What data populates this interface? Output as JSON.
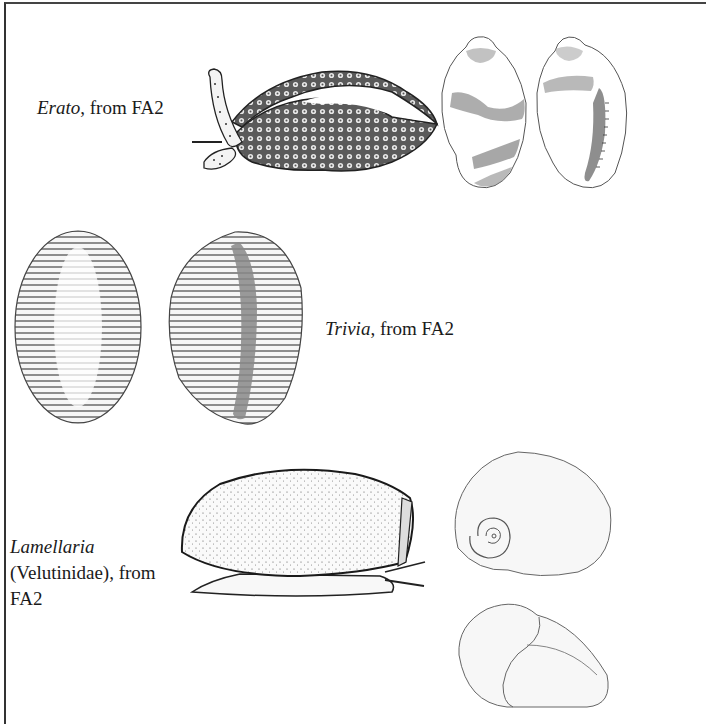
{
  "plate": {
    "sections": [
      {
        "genus": "Erato",
        "suffix": ", from FA2",
        "figures": [
          "animal-crawling",
          "shell-dorsal-banded",
          "shell-apertural-banded"
        ]
      },
      {
        "genus": "Trivia",
        "suffix": ", from FA2",
        "figures": [
          "shell-dorsal-ribbed",
          "shell-apertural-ribbed"
        ]
      },
      {
        "genus": "Lamellaria",
        "line2": "(Velutinidae), from",
        "line3": "FA2",
        "figures": [
          "animal-side-view",
          "shell-apical-view",
          "shell-apertural-view"
        ]
      }
    ]
  },
  "colors": {
    "ink": "#1a1a1a",
    "border": "#333333",
    "band": "#8a8a8a",
    "background": "#ffffff"
  }
}
